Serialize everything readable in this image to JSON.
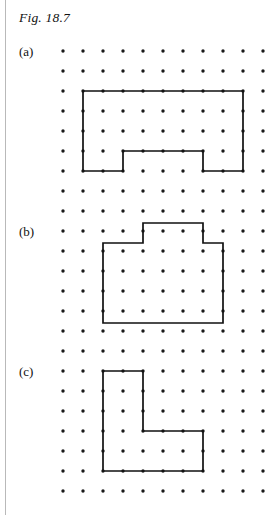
{
  "figure": {
    "caption": "Fig. 18.7",
    "left_rule": true,
    "background_color": "#ffffff",
    "ink_color": "#111111",
    "dot_color": "#1a1a1a"
  },
  "lattice": {
    "origin_x": 63,
    "origin_y": 51,
    "spacing": 20,
    "columns": 11,
    "rows": 23,
    "dot_radius": 1.7
  },
  "parts": [
    {
      "id": "a",
      "label": "(a)",
      "description": "rectangle with rectangular notch cut from bottom edge",
      "polygon_grid": [
        [
          1,
          2
        ],
        [
          9,
          2
        ],
        [
          9,
          6
        ],
        [
          7,
          6
        ],
        [
          7,
          5
        ],
        [
          3,
          5
        ],
        [
          3,
          6
        ],
        [
          1,
          6
        ]
      ],
      "polygon_px": "83,91 243,91 243,171 203,171 203,151 123,151 123,171 83,171"
    },
    {
      "id": "b",
      "label": "(b)",
      "description": "rectangle with rectangular bump on top edge",
      "polygon_grid": [
        [
          2,
          10
        ],
        [
          4,
          10
        ],
        [
          4,
          9
        ],
        [
          7,
          9
        ],
        [
          7,
          10
        ],
        [
          9,
          10
        ],
        [
          9,
          14
        ],
        [
          2,
          14
        ]
      ],
      "polygon_px": "103,243 143,243 143,223 203,223 203,243 223,243 223,323 103,323"
    },
    {
      "id": "c",
      "label": "(c)",
      "description": "L-shaped hexagon",
      "polygon_grid": [
        [
          2,
          16
        ],
        [
          4,
          16
        ],
        [
          4,
          19
        ],
        [
          7,
          19
        ],
        [
          7,
          21
        ],
        [
          2,
          21
        ]
      ],
      "polygon_px": "103,371 143,371 143,431 203,431 203,471 103,471"
    }
  ]
}
